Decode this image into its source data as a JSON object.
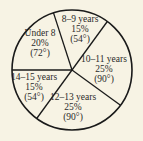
{
  "chart_data": {
    "type": "pie",
    "title": "",
    "start_angle_deg": 180,
    "direction": "clockwise",
    "categories": [
      "Under 8",
      "8–9 years",
      "10–11 years",
      "12–13 years",
      "14–15 years"
    ],
    "values": [
      20,
      15,
      25,
      25,
      15
    ],
    "degrees": [
      72,
      54,
      90,
      90,
      54
    ],
    "labels": [
      {
        "name": "Under 8",
        "percent": "20%",
        "degrees": "(72°)"
      },
      {
        "name": "8–9 years",
        "percent": "15%",
        "degrees": "(54°)"
      },
      {
        "name": "10–11 years",
        "percent": "25%",
        "degrees": "(90°)"
      },
      {
        "name": "12–13 years",
        "percent": "25%",
        "degrees": "(90°)"
      },
      {
        "name": "14–15 years",
        "percent": "15%",
        "degrees": "(54°)"
      }
    ],
    "legend": "none",
    "colors": {
      "background": "#f7f3e4",
      "fill": "#f7f3e4",
      "stroke": "#1a1a1a",
      "text": "#2a2a2a"
    }
  }
}
